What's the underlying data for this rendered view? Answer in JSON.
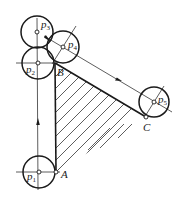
{
  "diagram": {
    "type": "mechanism-path-diagram",
    "colors": {
      "stroke": "#1a1a1a",
      "thin": "#333333",
      "background": "#ffffff"
    },
    "points": {
      "A": {
        "label": "A",
        "x": 56,
        "y": 172
      },
      "B": {
        "label": "B",
        "x": 55,
        "y": 63
      },
      "C": {
        "label": "C",
        "x": 146,
        "y": 117
      }
    },
    "circles": [
      {
        "id": "p1",
        "label": "p",
        "sub": "1",
        "cx": 39,
        "cy": 172,
        "r": 16
      },
      {
        "id": "p2",
        "label": "p",
        "sub": "2",
        "cx": 38,
        "cy": 63,
        "r": 16
      },
      {
        "id": "p3",
        "label": "p",
        "sub": "3",
        "cx": 37,
        "cy": 32,
        "r": 16
      },
      {
        "id": "p4",
        "label": "p",
        "sub": "4",
        "cx": 63,
        "cy": 47,
        "r": 16
      },
      {
        "id": "p5",
        "label": "p",
        "sub": "5",
        "cx": 154,
        "cy": 102,
        "r": 15
      }
    ],
    "path_labels": {
      "A": "A",
      "B": "B",
      "C": "C"
    }
  }
}
